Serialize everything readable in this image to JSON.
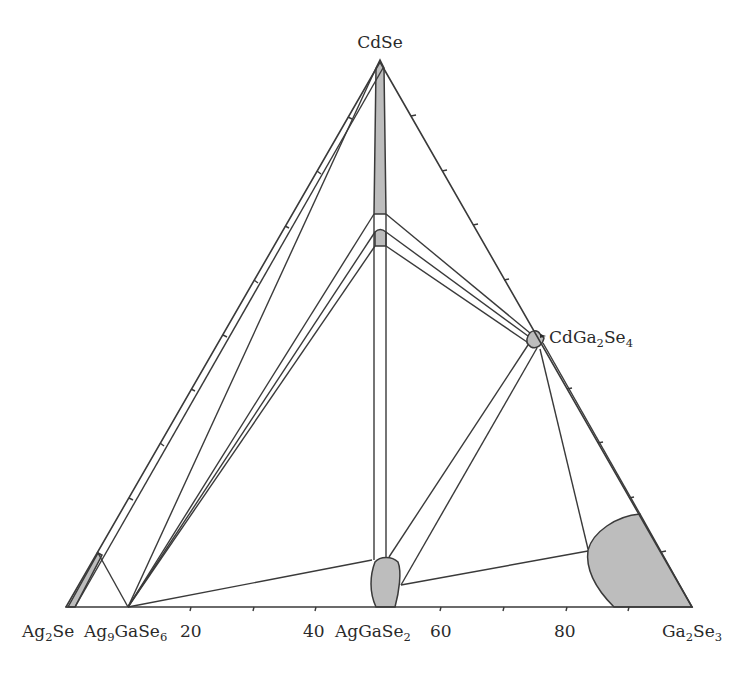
{
  "diagram": {
    "type": "ternary-phase-diagram",
    "vertices": {
      "top": "CdSe",
      "left": "Ag2Se",
      "right": "Ga2Se3"
    },
    "labels": {
      "cdse": "CdSe",
      "ag2se_main": "Ag",
      "ag2se_sub": "2",
      "ag2se_tail": "Se",
      "ag9gase6_main": "Ag",
      "ag9gase6_sub1": "9",
      "ag9gase6_mid": "GaSe",
      "ag9gase6_sub2": "6",
      "aggase2_main": "AgGaSe",
      "aggase2_sub": "2",
      "ga2se3_main": "Ga",
      "ga2se3_sub1": "2",
      "ga2se3_mid": "Se",
      "ga2se3_sub2": "3",
      "cdga2se4_main": "CdGa",
      "cdga2se4_sub1": "2",
      "cdga2se4_mid": "Se",
      "cdga2se4_sub2": "4"
    },
    "axis": {
      "base_tick_labels": [
        "20",
        "40",
        "60",
        "80"
      ],
      "base_tick_positions_percent": [
        10,
        20,
        30,
        40,
        50,
        60,
        70,
        80,
        90
      ],
      "unit": "mol% Ga2Se3"
    },
    "compounds": [
      {
        "name": "Ag9GaSe6",
        "position_percent": 10
      },
      {
        "name": "AgGaSe2",
        "position_percent": 50
      },
      {
        "name": "CdGa2Se4",
        "position": "midpoint CdSe–Ga2Se3"
      }
    ],
    "solid_solution_regions": [
      "CdSe-based (along CdSe–AgGaSe2 join, upper part)",
      "small island on CdSe–AgGaSe2 join",
      "AgGaSe2-based",
      "CdGa2Se4-based",
      "Ga2Se3-based (large)",
      "Ag2Se-based (narrow strip along Ag2Se–CdSe edge)"
    ],
    "colors": {
      "line": "#3a3a3a",
      "fill": "#bdbdbd",
      "background": "#ffffff"
    }
  }
}
